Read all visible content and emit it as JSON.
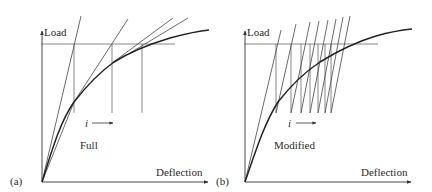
{
  "panels": [
    {
      "id": "a",
      "tag": "(a)",
      "y_label": "Load",
      "x_label": "Deflection",
      "method_label": "Full",
      "iteration_label": "i",
      "iteration_arrow": "⟶"
    },
    {
      "id": "b",
      "tag": "(b)",
      "y_label": "Load",
      "x_label": "Deflection",
      "method_label": "Modified",
      "iteration_label": "i",
      "iteration_arrow": "⟶"
    }
  ],
  "colors": {
    "line": "#3a3a3a",
    "curve": "#222222",
    "thin": "#555555",
    "background": "#ffffff"
  }
}
